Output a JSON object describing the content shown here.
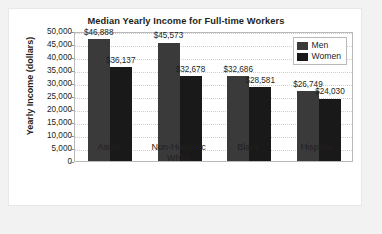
{
  "chart_data": {
    "type": "bar",
    "title": "Median Yearly Income for Full-time Workers",
    "xlabel": "",
    "ylabel": "Yearly Income (dollars)",
    "ylim": [
      0,
      50000
    ],
    "ytick_step": 5000,
    "grid": true,
    "legend_position": "top-right",
    "categories": [
      "Asian",
      "Non-Hispanic White",
      "Black",
      "Hispanic"
    ],
    "category_lines": [
      [
        "Asian"
      ],
      [
        "Non-Hispanic",
        "White"
      ],
      [
        "Black"
      ],
      [
        "Hispanic"
      ]
    ],
    "ytick_labels": [
      "50,000",
      "45,000",
      "40,000",
      "35,000",
      "30,000",
      "25,000",
      "20,000",
      "15,000",
      "10,000",
      "5,000",
      "0"
    ],
    "ytick_values": [
      50000,
      45000,
      40000,
      35000,
      30000,
      25000,
      20000,
      15000,
      10000,
      5000,
      0
    ],
    "series": [
      {
        "name": "Men",
        "color": "#3a3a3a",
        "values": [
          46888,
          45573,
          32686,
          26749
        ],
        "data_labels": [
          "$46,888",
          "$45,573",
          "$32,686",
          "$26,749"
        ]
      },
      {
        "name": "Women",
        "color": "#191919",
        "values": [
          36137,
          32678,
          28581,
          24030
        ],
        "data_labels": [
          "$36,137",
          "$32,678",
          "$28,581",
          "$24,030"
        ]
      }
    ]
  },
  "legend": {
    "items": [
      {
        "label": "Men",
        "color": "#3a3a3a"
      },
      {
        "label": "Women",
        "color": "#191919"
      }
    ]
  }
}
